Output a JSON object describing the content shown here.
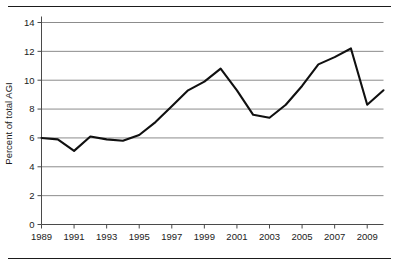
{
  "figure": {
    "top_rule": "horizontal-rule",
    "bottom_rule": "horizontal-rule"
  },
  "chart_data": {
    "type": "line",
    "title": "",
    "xlabel": "",
    "ylabel": "Percent of total AGI",
    "xlim": [
      1989,
      2010
    ],
    "ylim": [
      0,
      14
    ],
    "grid": true,
    "legend": "none",
    "y_ticks": [
      0,
      2,
      4,
      6,
      8,
      10,
      12,
      14
    ],
    "y_tick_labels": [
      "0",
      "2",
      "4",
      "6",
      "8",
      "10",
      "12",
      "14"
    ],
    "x_ticks": [
      1989,
      1991,
      1993,
      1995,
      1997,
      1999,
      2001,
      2003,
      2005,
      2007,
      2009
    ],
    "x_tick_labels": [
      "1989",
      "1991",
      "1993",
      "1995",
      "1997",
      "1999",
      "2001",
      "2003",
      "2005",
      "2007",
      "2009"
    ],
    "x": [
      1989,
      1990,
      1991,
      1992,
      1993,
      1994,
      1995,
      1996,
      1997,
      1998,
      1999,
      2000,
      2001,
      2002,
      2003,
      2004,
      2005,
      2006,
      2007,
      2008,
      2009,
      2010
    ],
    "series": [
      {
        "name": "Percent of total AGI",
        "color": "#101010",
        "values": [
          6.0,
          5.9,
          5.1,
          6.1,
          5.9,
          5.8,
          6.2,
          7.1,
          8.2,
          9.3,
          9.9,
          10.8,
          9.3,
          7.6,
          7.4,
          8.3,
          9.6,
          11.1,
          11.6,
          12.2,
          8.3,
          9.3
        ]
      }
    ]
  }
}
